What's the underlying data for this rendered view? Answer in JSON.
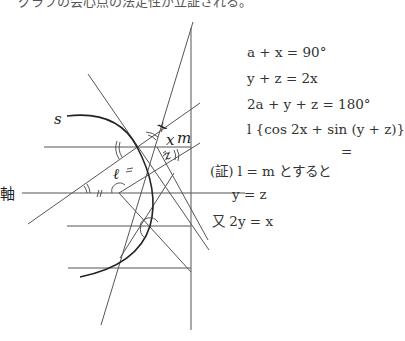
{
  "caption": "グラフの会心点の法定性が立証される。",
  "labels": {
    "s": "s",
    "axis": "軸",
    "x": "x",
    "m": "m",
    "z": "z",
    "ell": "ℓ"
  },
  "equations": [
    "a + x = 90°",
    "y + z = 2x",
    "2a + y + z = 180°",
    "l {cos 2x + sin (y + z)}",
    "="
  ],
  "proof": {
    "prefix": "(証)",
    "line1": "l = m とすると",
    "line2": "y = z",
    "line3_prefix": "又",
    "line3": "2y = x"
  }
}
